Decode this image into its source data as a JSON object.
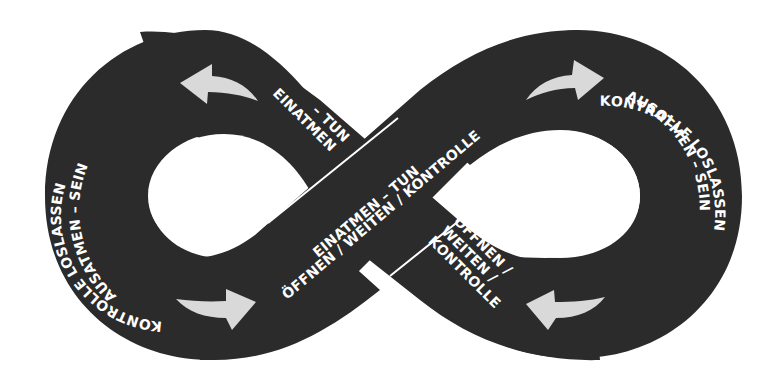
{
  "diagram": {
    "type": "infinity-loop",
    "colors": {
      "band": "#2b2b2b",
      "arrow": "#d9d9d9",
      "text": "#ffffff",
      "background": "#ffffff",
      "separator": "#ffffff"
    },
    "left_loop": {
      "outer_line1": "AUSATMEN – SEIN",
      "outer_line2": "KONTROLLE LOSLASSEN",
      "top_right_line1": "EINATMEN",
      "top_right_line2": "– TUN"
    },
    "crossover_band": {
      "line1": "EINATMEN – TUN",
      "line2": "ÖFFNEN / WEITEN / KONTROLLE"
    },
    "right_loop": {
      "outer_line1": "AUSATMEN – SEIN",
      "outer_line2": "KONTROLLE LOSLASSEN",
      "bottom_left_line1": "ÖFFNEN /",
      "bottom_left_line2": "WEITEN /",
      "bottom_left_line3": "KONTROLLE"
    },
    "arrows": [
      {
        "position": "top-left",
        "direction": "left"
      },
      {
        "position": "top-right",
        "direction": "right"
      },
      {
        "position": "bottom-left",
        "direction": "right"
      },
      {
        "position": "bottom-right",
        "direction": "left"
      }
    ]
  }
}
